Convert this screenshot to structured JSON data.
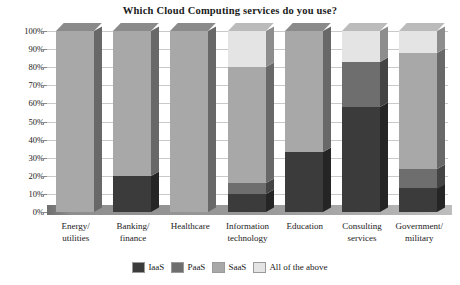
{
  "chart_data": {
    "type": "bar",
    "subtype": "stacked-column-100pct-3d",
    "title": "Which Cloud Computing services do you use?",
    "xlabel": "",
    "ylabel": "",
    "ylim": [
      0,
      100
    ],
    "ytick_labels": [
      "100%",
      "90%",
      "80%",
      "70%",
      "60%",
      "50%",
      "40%",
      "30%",
      "20%",
      "10%",
      "0%"
    ],
    "ytick_values": [
      100,
      90,
      80,
      70,
      60,
      50,
      40,
      30,
      20,
      10,
      0
    ],
    "grid": true,
    "legend_position": "bottom",
    "categories": [
      "Energy/ utilities",
      "Banking/ finance",
      "Healthcare",
      "Information technology",
      "Education",
      "Consulting services",
      "Government/ military"
    ],
    "category_lines": [
      [
        "Energy/",
        "utilities"
      ],
      [
        "Banking/",
        "finance"
      ],
      [
        "Healthcare",
        ""
      ],
      [
        "Information",
        "technology"
      ],
      [
        "Education",
        ""
      ],
      [
        "Consulting",
        "services"
      ],
      [
        "Government/",
        "military"
      ]
    ],
    "series": [
      {
        "name": "IaaS",
        "color": "#3b3b3b",
        "values": [
          0,
          20,
          0,
          10,
          33,
          58,
          13
        ]
      },
      {
        "name": "PaaS",
        "color": "#6e6e6e",
        "values": [
          0,
          0,
          0,
          6,
          0,
          25,
          11
        ]
      },
      {
        "name": "SaaS",
        "color": "#a8a8a8",
        "values": [
          100,
          80,
          100,
          64,
          67,
          0,
          64
        ]
      },
      {
        "name": "All of the above",
        "color": "#e4e4e4",
        "values": [
          0,
          0,
          0,
          20,
          0,
          17,
          12
        ]
      }
    ]
  },
  "legend": {
    "items": [
      {
        "label": "IaaS"
      },
      {
        "label": "PaaS"
      },
      {
        "label": "SaaS"
      },
      {
        "label": "All of the above"
      }
    ]
  },
  "colors": {
    "iaas": "#3b3b3b",
    "paas": "#6e6e6e",
    "saas": "#a8a8a8",
    "all_of_the_above": "#e4e4e4",
    "gridline": "#c9c9c9",
    "axis": "#8a8a8a",
    "background": "#ffffff",
    "text": "#1a1a1a"
  }
}
